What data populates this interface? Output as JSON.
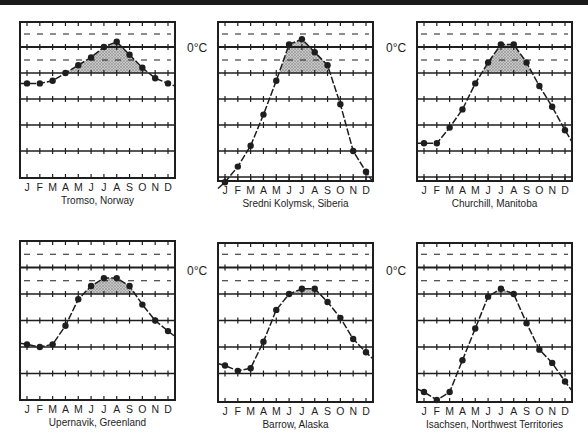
{
  "figure": {
    "zero_label": "0°C",
    "month_labels": [
      "J",
      "F",
      "M",
      "A",
      "M",
      "J",
      "J",
      "A",
      "S",
      "O",
      "N",
      "D"
    ]
  },
  "colors": {
    "ink": "#1e1e1e",
    "shade": "#9a9a9a",
    "background": "#ffffff"
  },
  "chart_data": [
    {
      "type": "line",
      "title": "Tromso, Norway",
      "categories": [
        "J",
        "F",
        "M",
        "A",
        "M",
        "J",
        "J",
        "A",
        "S",
        "O",
        "N",
        "D"
      ],
      "values": [
        -4,
        -4,
        -3,
        0,
        3,
        6,
        10,
        12,
        7,
        2,
        -2,
        -4
      ],
      "ylabel": "°C",
      "annotation": "0°C",
      "shaded": "months above 0°C",
      "grid": true,
      "ylim": [
        -40,
        20
      ]
    },
    {
      "type": "line",
      "title": "Sredni Kolymsk, Siberia",
      "categories": [
        "J",
        "F",
        "M",
        "A",
        "M",
        "J",
        "J",
        "A",
        "S",
        "O",
        "N",
        "D"
      ],
      "values": [
        -42,
        -36,
        -28,
        -16,
        -3,
        11,
        13,
        8,
        3,
        -12,
        -30,
        -38
      ],
      "ylabel": "°C",
      "annotation": "0°C",
      "shaded": "months above 0°C",
      "grid": true,
      "ylim": [
        -40,
        20
      ]
    },
    {
      "type": "line",
      "title": "Churchill, Manitoba",
      "categories": [
        "J",
        "F",
        "M",
        "A",
        "M",
        "J",
        "J",
        "A",
        "S",
        "O",
        "N",
        "D"
      ],
      "values": [
        -27,
        -27,
        -21,
        -14,
        -4,
        4,
        11,
        11,
        4,
        -5,
        -13,
        -22
      ],
      "ylabel": "°C",
      "shaded": "months above 0°C",
      "grid": true,
      "ylim": [
        -40,
        20
      ]
    },
    {
      "type": "line",
      "title": "Upernavik, Greenland",
      "categories": [
        "J",
        "F",
        "M",
        "A",
        "M",
        "J",
        "J",
        "A",
        "S",
        "O",
        "N",
        "D"
      ],
      "values": [
        -19,
        -20,
        -19,
        -12,
        -2,
        3,
        6,
        6,
        3,
        -4,
        -10,
        -14
      ],
      "ylabel": "°C",
      "annotation": "0°C",
      "shaded": "months above 0°C",
      "grid": true,
      "ylim": [
        -40,
        20
      ]
    },
    {
      "type": "line",
      "title": "Barrow, Alaska",
      "categories": [
        "J",
        "F",
        "M",
        "A",
        "M",
        "J",
        "J",
        "A",
        "S",
        "O",
        "N",
        "D"
      ],
      "values": [
        -27,
        -29,
        -28,
        -18,
        -6,
        0,
        2,
        2,
        -3,
        -9,
        -17,
        -22
      ],
      "ylabel": "°C",
      "annotation": "0°C",
      "shaded": "months above 0°C",
      "grid": true,
      "ylim": [
        -40,
        20
      ]
    },
    {
      "type": "line",
      "title": "Isachsen, Northwest Territories",
      "categories": [
        "J",
        "F",
        "M",
        "A",
        "M",
        "J",
        "J",
        "A",
        "S",
        "O",
        "N",
        "D"
      ],
      "values": [
        -37,
        -40,
        -37,
        -25,
        -13,
        -1,
        2,
        0,
        -11,
        -21,
        -26,
        -33
      ],
      "ylabel": "°C",
      "shaded": "months above 0°C",
      "grid": true,
      "ylim": [
        -40,
        20
      ]
    }
  ],
  "panels": [
    {
      "x": 20,
      "y": 22,
      "w": 155,
      "h": 156,
      "zero_y": 73,
      "step": 26
    },
    {
      "x": 218,
      "y": 22,
      "w": 155,
      "h": 159,
      "zero_y": 73,
      "step": 26
    },
    {
      "x": 417,
      "y": 22,
      "w": 155,
      "h": 159,
      "zero_y": 73,
      "step": 26
    },
    {
      "x": 20,
      "y": 241,
      "w": 155,
      "h": 159,
      "zero_y": 294,
      "step": 26.5
    },
    {
      "x": 218,
      "y": 243,
      "w": 155,
      "h": 159,
      "zero_y": 294,
      "step": 26.5
    },
    {
      "x": 417,
      "y": 243,
      "w": 155,
      "h": 159,
      "zero_y": 294,
      "step": 26.5
    }
  ],
  "zero_labels": [
    {
      "x": 187,
      "y": 52,
      "text": "0°C"
    },
    {
      "x": 386,
      "y": 52,
      "text": "0°C"
    },
    {
      "x": 187,
      "y": 275,
      "text": "0°C"
    },
    {
      "x": 386,
      "y": 275,
      "text": "0°C"
    }
  ]
}
